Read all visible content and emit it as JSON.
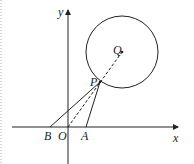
{
  "diagram": {
    "labels": {
      "x_axis": "x",
      "y_axis": "y",
      "origin": "O",
      "point_a": "A",
      "point_b": "B",
      "point_p": "P",
      "center_q": "Q"
    },
    "colors": {
      "stroke": "#222222",
      "border_dots": "#aaaaaa"
    }
  }
}
